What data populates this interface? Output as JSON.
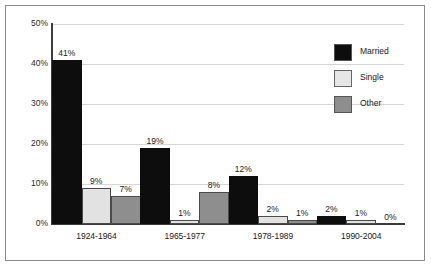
{
  "chart_data": {
    "type": "bar",
    "title": "",
    "subtitle": "",
    "xlabel": "",
    "ylabel": "",
    "categories": [
      "1924-1964",
      "1965-1977",
      "1978-1989",
      "1990-2004"
    ],
    "series": [
      {
        "name": "Married",
        "color": "#0d0d0d",
        "values": [
          41,
          19,
          12,
          2
        ],
        "labels": [
          "41%",
          "19%",
          "12%",
          "2%"
        ]
      },
      {
        "name": "Single",
        "color": "#e2e2e2",
        "values": [
          9,
          1,
          2,
          1
        ],
        "labels": [
          "9%",
          "1%",
          "2%",
          "1%"
        ]
      },
      {
        "name": "Other",
        "color": "#8e8e8e",
        "values": [
          7,
          8,
          1,
          0
        ],
        "labels": [
          "7%",
          "8%",
          "1%",
          "0%"
        ]
      }
    ],
    "ylim": [
      0,
      50
    ],
    "yticks": [
      0,
      10,
      20,
      30,
      40,
      50
    ],
    "ytick_labels": [
      "0%",
      "10%",
      "20%",
      "30%",
      "40%",
      "50%"
    ],
    "grid": true,
    "grid_axis": "y",
    "legend_position": "top-right",
    "value_labels_shown": true
  }
}
